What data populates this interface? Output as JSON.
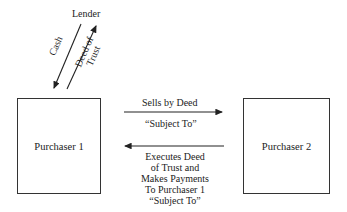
{
  "nodes": {
    "lender": "Lender",
    "purchaser1": "Purchaser 1",
    "purchaser2": "Purchaser 2"
  },
  "edges": {
    "cash": "Cash",
    "deed_of_trust_line1": "Deed of",
    "deed_of_trust_line2": "Trust",
    "sells_top": "Sells by Deed",
    "sells_bottom": "“Subject To”",
    "executes": [
      "Executes Deed",
      "of Trust and",
      "Makes Payments",
      "To Purchaser 1",
      "“Subject To”"
    ]
  }
}
